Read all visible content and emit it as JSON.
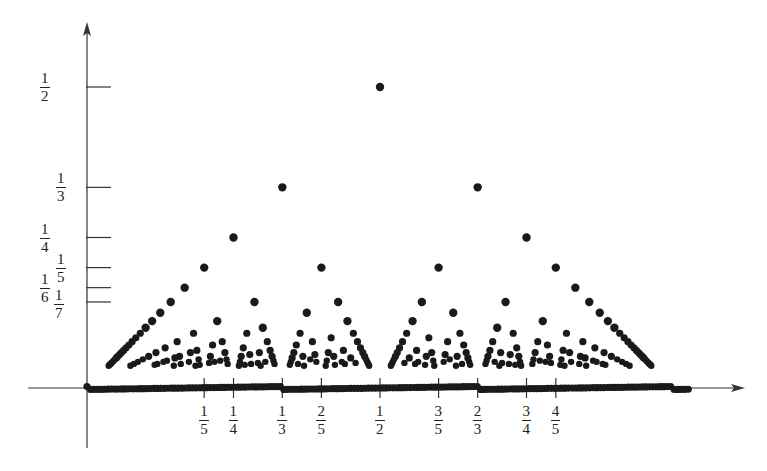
{
  "chart_data": {
    "type": "scatter",
    "title": "",
    "xlabel": "",
    "ylabel": "",
    "xlim": [
      0,
      1
    ],
    "ylim": [
      0,
      0.5
    ],
    "max_denominator": 27,
    "grid": false,
    "legend": null,
    "x_ticks": [
      {
        "value": 0.2,
        "num": "1",
        "den": "5"
      },
      {
        "value": 0.25,
        "num": "1",
        "den": "4"
      },
      {
        "value": 0.3333,
        "num": "1",
        "den": "3"
      },
      {
        "value": 0.4,
        "num": "2",
        "den": "5"
      },
      {
        "value": 0.5,
        "num": "1",
        "den": "2"
      },
      {
        "value": 0.6,
        "num": "3",
        "den": "5"
      },
      {
        "value": 0.6667,
        "num": "2",
        "den": "3"
      },
      {
        "value": 0.75,
        "num": "3",
        "den": "4"
      },
      {
        "value": 0.8,
        "num": "4",
        "den": "5"
      }
    ],
    "y_ticks": [
      {
        "value": 0.5,
        "num": "1",
        "den": "2"
      },
      {
        "value": 0.3333,
        "num": "1",
        "den": "3"
      },
      {
        "value": 0.25,
        "num": "1",
        "den": "4"
      },
      {
        "value": 0.2,
        "num": "1",
        "den": "5"
      },
      {
        "value": 0.1667,
        "num": "1",
        "den": "6"
      },
      {
        "value": 0.1429,
        "num": "1",
        "den": "7"
      }
    ],
    "points_sample": [
      {
        "x": 0.5,
        "y": 0.5
      },
      {
        "x": 0.3333,
        "y": 0.3333
      },
      {
        "x": 0.6667,
        "y": 0.3333
      },
      {
        "x": 0.25,
        "y": 0.25
      },
      {
        "x": 0.75,
        "y": 0.25
      },
      {
        "x": 0.2,
        "y": 0.2
      },
      {
        "x": 0.4,
        "y": 0.2
      },
      {
        "x": 0.6,
        "y": 0.2
      },
      {
        "x": 0.8,
        "y": 0.2
      }
    ],
    "colors": {
      "points": "#1a1a1a",
      "axes": "#333333"
    }
  }
}
